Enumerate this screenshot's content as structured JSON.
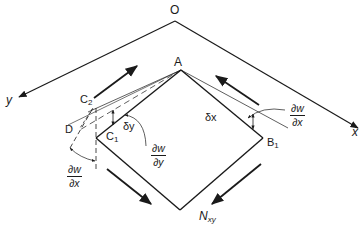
{
  "figure": {
    "colors": {
      "line": "#1a1a1a",
      "background": "#ffffff"
    }
  },
  "points": {
    "origin": "O",
    "apex": "A",
    "c1": "C",
    "c1_sub": "1",
    "c2": "C",
    "c2_sub": "2",
    "b1": "B",
    "b1_sub": "1",
    "d": "D"
  },
  "axes": {
    "x_label": "x",
    "y_label": "y"
  },
  "increments": {
    "dx": "δx",
    "dy": "δy"
  },
  "slopes": {
    "dw_dx_right": {
      "num": "∂w",
      "den": "∂x"
    },
    "dw_dy": {
      "num": "∂w",
      "den": "∂y"
    },
    "dw_dx_left": {
      "num": "∂w",
      "den": "∂x"
    }
  },
  "force": {
    "label": "N",
    "sub": "xy"
  }
}
